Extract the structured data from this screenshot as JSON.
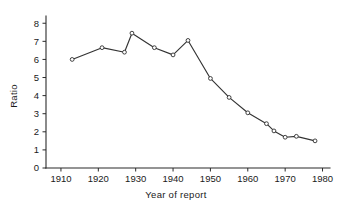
{
  "chart_data": {
    "type": "line",
    "title": "",
    "subtitle": "",
    "xlabel": "Year of report",
    "ylabel": "Ratio",
    "xlim": [
      1906,
      1982
    ],
    "ylim": [
      0,
      8.4
    ],
    "xticks": [
      1910,
      1920,
      1930,
      1940,
      1950,
      1960,
      1970,
      1980
    ],
    "xtick_labels": [
      "1910",
      "1920",
      "1930",
      "1940",
      "1950",
      "1960",
      "1970",
      "1980"
    ],
    "yticks": [
      0,
      1,
      2,
      3,
      4,
      5,
      6,
      7,
      8
    ],
    "ytick_labels": [
      "0",
      "1",
      "2",
      "3",
      "4",
      "5",
      "6",
      "7",
      "8"
    ],
    "grid": false,
    "legend": false,
    "legend_position": "none",
    "marker": "open-circle",
    "line_color": "#333333",
    "marker_face_color": "#ffffff",
    "marker_edge_color": "#2e2e2e",
    "axis_color": "#2b2b2b",
    "background_color": "#ffffff",
    "x": [
      1913,
      1921,
      1927,
      1929,
      1935,
      1940,
      1944,
      1950,
      1955,
      1960,
      1965,
      1967,
      1970,
      1973,
      1978
    ],
    "values": [
      6.0,
      6.65,
      6.4,
      7.45,
      6.65,
      6.25,
      7.05,
      4.95,
      3.9,
      3.05,
      2.45,
      2.05,
      1.7,
      1.75,
      1.5
    ],
    "series": [
      {
        "name": "Ratio",
        "x": [
          1913,
          1921,
          1927,
          1929,
          1935,
          1940,
          1944,
          1950,
          1955,
          1960,
          1965,
          1967,
          1970,
          1973,
          1978
        ],
        "values": [
          6.0,
          6.65,
          6.4,
          7.45,
          6.65,
          6.25,
          7.05,
          4.95,
          3.9,
          3.05,
          2.45,
          2.05,
          1.7,
          1.75,
          1.5
        ]
      }
    ],
    "annotations": []
  },
  "figure": {
    "name": "ratio-year-of-report-line-chart"
  }
}
